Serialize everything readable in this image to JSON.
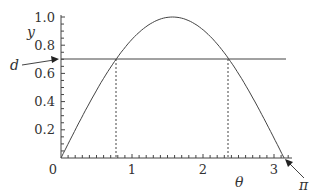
{
  "chart_data": {
    "type": "line",
    "title": "",
    "xlabel": "θ",
    "ylabel": "y",
    "xlim": [
      0,
      3.3
    ],
    "ylim": [
      0,
      1.0
    ],
    "grid": false,
    "x_ticks": [
      "0",
      "1",
      "2",
      "3"
    ],
    "y_ticks": [
      "0.2",
      "0.4",
      "0.6",
      "0.8",
      "1.0"
    ],
    "origin_label": "0",
    "series": [
      {
        "name": "y = sin θ",
        "style": "solid",
        "function": "sin",
        "x_range": [
          0,
          3.1416
        ]
      },
      {
        "name": "d",
        "style": "solid",
        "horizontal_y": 0.707
      }
    ],
    "dashed_verticals": [
      0.785,
      2.356
    ],
    "annotations": [
      {
        "text": "d",
        "points_to": {
          "x": 0,
          "y": 0.707
        }
      },
      {
        "text": "π",
        "points_to": {
          "x": 3.1416,
          "y": 0
        }
      }
    ],
    "colors": {
      "line": "#444444",
      "text": "#333333"
    }
  },
  "labels": {
    "y_axis": "y",
    "x_axis": "θ",
    "d": "d",
    "pi": "π",
    "origin": "0",
    "yt": [
      "0.2",
      "0.4",
      "0.6",
      "0.8",
      "1.0"
    ],
    "xt": [
      "1",
      "2",
      "3"
    ]
  }
}
